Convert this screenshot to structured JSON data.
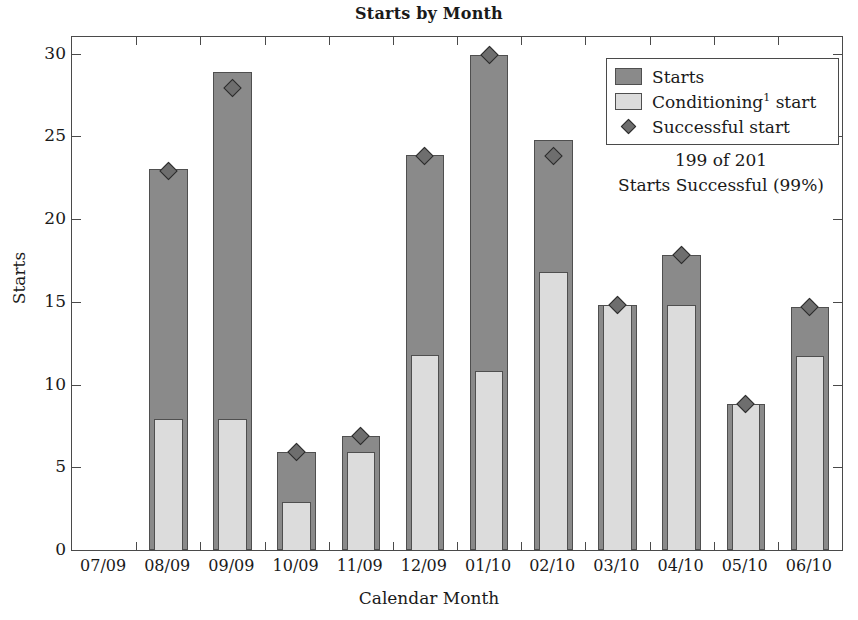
{
  "chart_data": {
    "type": "bar",
    "title": "Starts by Month",
    "xlabel": "Calendar Month",
    "ylabel": "Starts",
    "ylim": [
      0,
      31
    ],
    "yticks": [
      0,
      5,
      10,
      15,
      20,
      25,
      30
    ],
    "ytick_labels": [
      "0",
      "5",
      "10",
      "15",
      "20",
      "25",
      "30"
    ],
    "grid": false,
    "legend_position": "upper right",
    "stacked_overlay": true,
    "categories": [
      "07/09",
      "08/09",
      "09/09",
      "10/09",
      "11/09",
      "12/09",
      "01/10",
      "02/10",
      "03/10",
      "04/10",
      "05/10",
      "06/10"
    ],
    "series": [
      {
        "name": "Starts",
        "type": "bar",
        "color": "#8a8a8a",
        "values": [
          0,
          23.0,
          28.9,
          5.9,
          6.9,
          23.9,
          29.9,
          24.8,
          14.8,
          17.8,
          8.8,
          14.7
        ]
      },
      {
        "name": "Conditioning¹ start",
        "type": "bar-overlay",
        "color": "#dcdcdc",
        "values": [
          0,
          7.9,
          7.9,
          2.9,
          5.9,
          11.8,
          10.8,
          16.8,
          14.8,
          14.8,
          8.8,
          11.7
        ]
      },
      {
        "name": "Successful start",
        "type": "marker",
        "marker": "diamond",
        "color": "#6e6e6e",
        "values": [
          null,
          22.9,
          27.9,
          5.9,
          6.9,
          23.8,
          29.9,
          23.8,
          14.8,
          17.8,
          8.8,
          14.7
        ]
      }
    ],
    "annotations": [
      {
        "line1": "199 of 201",
        "line2": "Starts Successful (99%)"
      }
    ],
    "legend_entries": [
      {
        "label": "Starts",
        "label_sup": "",
        "label_rest": "",
        "swatch": "dark-gray-square"
      },
      {
        "label": "Conditioning",
        "label_sup": "1",
        "label_rest": " start",
        "swatch": "light-gray-square"
      },
      {
        "label": "Successful start",
        "label_sup": "",
        "label_rest": "",
        "swatch": "gray-diamond"
      }
    ]
  },
  "figure": {
    "title": "Starts by Month",
    "x_axis_title": "Calendar Month",
    "y_axis_title": "Starts"
  },
  "legend": {
    "starts_label": "Starts",
    "conditioning_label": "Conditioning",
    "conditioning_sup": "1",
    "conditioning_rest": " start",
    "successful_label": "Successful start"
  },
  "annotation": {
    "line1": "199 of 201",
    "line2": "Starts Successful (99%)"
  },
  "colors": {
    "starts_fill": "#8a8a8a",
    "conditioning_fill": "#dcdcdc",
    "marker_fill": "#6e6e6e",
    "axis": "#4a4a4a"
  }
}
